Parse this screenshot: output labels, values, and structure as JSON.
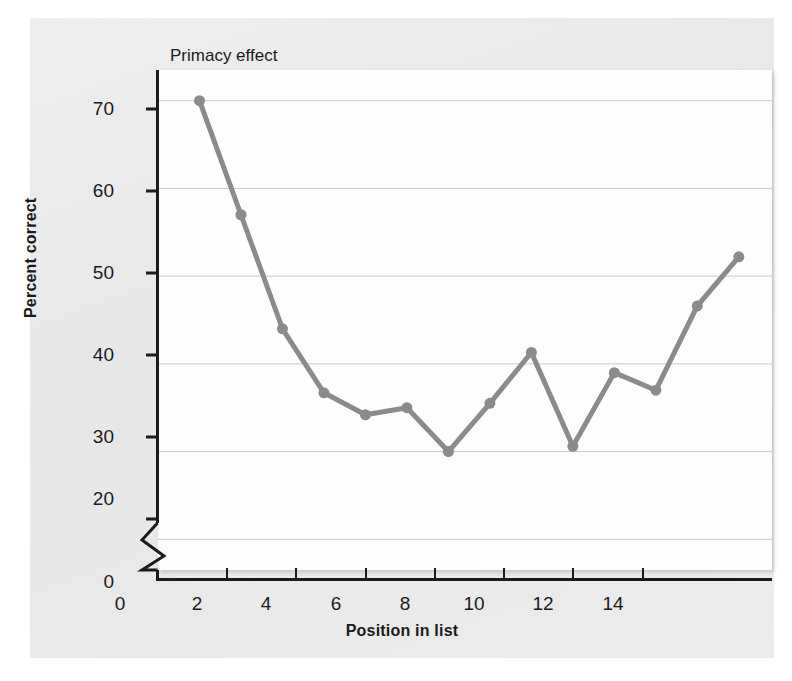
{
  "figure": {
    "background_color": "#ebebeb",
    "plot_background_color": "#fefefe"
  },
  "chart_data": {
    "type": "line",
    "title": "",
    "xlabel": "Position in list",
    "ylabel": "Percent correct",
    "x": [
      1,
      2,
      3,
      4,
      5,
      6,
      7,
      8,
      9,
      10,
      11,
      12,
      13,
      14
    ],
    "values": [
      70.0,
      57.0,
      44.0,
      36.7,
      34.2,
      35.0,
      30.0,
      35.5,
      41.3,
      30.6,
      39.0,
      37.0,
      46.6,
      52.2
    ],
    "series": [
      {
        "name": "Percent correct",
        "color": "#8b8b8b",
        "marker": "circle",
        "values": [
          70.0,
          57.0,
          44.0,
          36.7,
          34.2,
          35.0,
          30.0,
          35.5,
          41.3,
          30.6,
          39.0,
          37.0,
          46.6,
          52.2
        ]
      }
    ],
    "xlim": [
      0,
      14.8
    ],
    "ylim": [
      16.5,
      73.5
    ],
    "xticks": [
      0,
      2,
      4,
      6,
      8,
      10,
      12,
      14
    ],
    "xticklabels": [
      "0",
      "2",
      "4",
      "6",
      "8",
      "10",
      "12",
      "14"
    ],
    "yticks": [
      20,
      30,
      40,
      50,
      60,
      70
    ],
    "yticklabels": [
      "20",
      "30",
      "40",
      "50",
      "60",
      "70"
    ],
    "y_origin_label": "0",
    "axis_break": true,
    "grid": true,
    "grid_axis": "y",
    "grid_color": "#c9c9c9",
    "legend": null,
    "annotations": [
      {
        "text": "Primacy effect",
        "x": 1.3,
        "y": 73.2
      },
      {
        "text": "Recency effect",
        "x": 10.6,
        "y": 55.4
      }
    ]
  }
}
